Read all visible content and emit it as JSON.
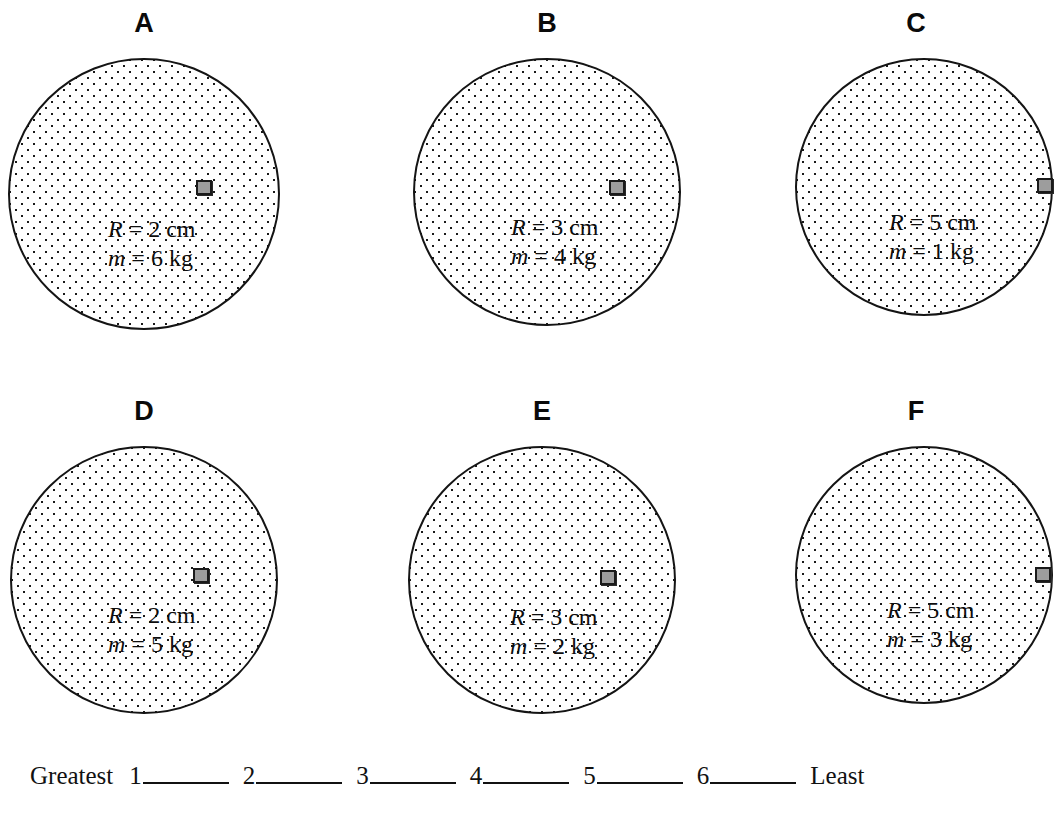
{
  "page": {
    "kind": "physics-ranking-task-worksheet",
    "background_color": "#ffffff",
    "ink_color": "#111111"
  },
  "panels": [
    {
      "letter": "A",
      "radius_label": "R = 2 cm",
      "mass_label": "m = 6 kg",
      "radius_symbol": "R",
      "radius_value": "= 2 cm",
      "mass_symbol": "m",
      "mass_value": "= 6 kg",
      "radius_cm": 2,
      "mass_kg": 6,
      "block_color": "#9d9d9d",
      "block_position": "inside-right-of-rim"
    },
    {
      "letter": "B",
      "radius_label": "R = 3 cm",
      "mass_label": "m = 4 kg",
      "radius_symbol": "R",
      "radius_value": "= 3 cm",
      "mass_symbol": "m",
      "mass_value": "= 4 kg",
      "radius_cm": 3,
      "mass_kg": 4,
      "block_color": "#9d9d9d",
      "block_position": "inside-right-of-rim"
    },
    {
      "letter": "C",
      "radius_label": "R = 5 cm",
      "mass_label": "m = 1 kg",
      "radius_symbol": "R",
      "radius_value": "= 5 cm",
      "mass_symbol": "m",
      "mass_value": "= 1 kg",
      "radius_cm": 5,
      "mass_kg": 1,
      "block_color": "#9d9d9d",
      "block_position": "on-rim"
    },
    {
      "letter": "D",
      "radius_label": "R = 2 cm",
      "mass_label": "m = 5 kg",
      "radius_symbol": "R",
      "radius_value": "= 2 cm",
      "mass_symbol": "m",
      "mass_value": "= 5 kg",
      "radius_cm": 2,
      "mass_kg": 5,
      "block_color": "#9d9d9d",
      "block_position": "inside-right-of-rim"
    },
    {
      "letter": "E",
      "radius_label": "R = 3 cm",
      "mass_label": "m = 2 kg",
      "radius_symbol": "R",
      "radius_value": "= 3 cm",
      "mass_symbol": "m",
      "mass_value": "= 2 kg",
      "radius_cm": 3,
      "mass_kg": 2,
      "block_color": "#9d9d9d",
      "block_position": "inside-right-of-rim"
    },
    {
      "letter": "F",
      "radius_label": "R = 5 cm",
      "mass_label": "m = 3 kg",
      "radius_symbol": "R",
      "radius_value": "= 5 cm",
      "mass_symbol": "m",
      "mass_value": "= 3 kg",
      "radius_cm": 5,
      "mass_kg": 3,
      "block_color": "#9d9d9d",
      "block_position": "on-rim"
    }
  ],
  "ranking": {
    "greatest_label": "Greatest",
    "least_label": "Least",
    "slots": [
      "1",
      "2",
      "3",
      "4",
      "5",
      "6"
    ],
    "answers": [
      "",
      "",
      "",
      "",
      "",
      ""
    ]
  }
}
